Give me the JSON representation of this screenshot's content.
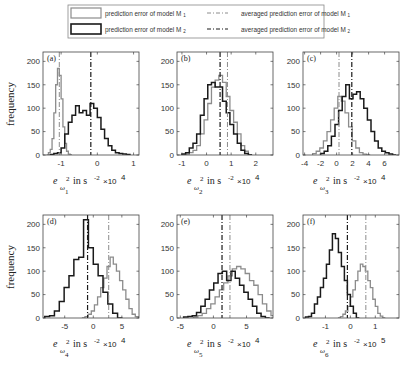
{
  "legend": {
    "entries": [
      {
        "label": "prediction error of model M₁",
        "style": "gray-solid",
        "color": "#8c8c8c"
      },
      {
        "label": "prediction error of model M₂",
        "style": "black-solid",
        "color": "#1a1a1a"
      },
      {
        "label": "averaged prediction error of model M₁",
        "style": "gray-dashdot",
        "color": "#8c8c8c"
      },
      {
        "label": "averaged prediction error of model M₂",
        "style": "black-dashdot",
        "color": "#1a1a1a"
      }
    ],
    "m1_text": "prediction error of model M",
    "m2_text": "prediction error of model M",
    "avg_text": "averaged prediction error of model M",
    "sub1": "1",
    "sub2": "2"
  },
  "ylabel": "frequency",
  "colors": {
    "m1": "#8c8c8c",
    "m2": "#1a1a1a",
    "axis": "#444444"
  },
  "chart_data": [
    {
      "type": "bar",
      "panel": "(a)",
      "title": "",
      "xlabel": "e_{ω1}^2 in s^-2 ×10^4",
      "ylabel": "frequency",
      "xlim": [
        -1.5,
        1.15
      ],
      "ylim": [
        0,
        220
      ],
      "xticks": [
        -1,
        0,
        1
      ],
      "yticks": [
        0,
        50,
        100,
        150,
        200
      ],
      "omega_index": "1",
      "scale": "×10",
      "scale_exp": "4",
      "series": [
        {
          "name": "prediction error of model M1",
          "bin_start": -1.4,
          "bin_width": 0.05,
          "values": [
            0,
            5,
            12,
            35,
            90,
            150,
            185,
            170,
            120,
            60,
            25,
            8,
            2,
            0
          ]
        },
        {
          "name": "prediction error of model M2",
          "bin_start": -1.3,
          "bin_width": 0.1,
          "values": [
            1,
            3,
            5,
            15,
            45,
            70,
            85,
            105,
            90,
            95,
            85,
            110,
            100,
            80,
            55,
            35,
            20,
            10,
            5,
            3,
            2,
            1
          ]
        }
      ],
      "avg": {
        "m1": -1.05,
        "m2": -0.18
      }
    },
    {
      "type": "bar",
      "panel": "(b)",
      "title": "",
      "xlabel": "e_{ω2}^2 in s^-2 ×10^4",
      "ylabel": "",
      "xlim": [
        -1.2,
        2.7
      ],
      "ylim": [
        0,
        220
      ],
      "xticks": [
        -1,
        0,
        1,
        2
      ],
      "yticks": [
        0,
        50,
        100,
        150,
        200
      ],
      "omega_index": "2",
      "scale": "×10",
      "scale_exp": "4",
      "series": [
        {
          "name": "prediction error of model M1",
          "bin_start": -1.0,
          "bin_width": 0.15,
          "values": [
            0,
            2,
            5,
            10,
            20,
            45,
            75,
            110,
            145,
            160,
            170,
            155,
            125,
            95,
            70,
            45,
            20,
            8,
            0
          ]
        },
        {
          "name": "prediction error of model M2",
          "bin_start": -1.0,
          "bin_width": 0.15,
          "values": [
            2,
            5,
            15,
            25,
            45,
            85,
            120,
            150,
            155,
            145,
            145,
            115,
            90,
            65,
            45,
            25,
            10,
            3,
            0
          ]
        }
      ],
      "avg": {
        "m1": 0.85,
        "m2": 0.55
      }
    },
    {
      "type": "bar",
      "panel": "(c)",
      "title": "",
      "xlabel": "e_{ω3}^2 in s^-2 ×10^4",
      "ylabel": "",
      "xlim": [
        -4.2,
        7.8
      ],
      "ylim": [
        0,
        220
      ],
      "xticks": [
        -4,
        -2,
        0,
        2,
        4,
        6
      ],
      "yticks": [
        0,
        50,
        100,
        150,
        200
      ],
      "omega_index": "3",
      "scale": "×10",
      "scale_exp": "4",
      "series": [
        {
          "name": "prediction error of model M1",
          "bin_start": -3.0,
          "bin_width": 0.45,
          "values": [
            3,
            8,
            15,
            30,
            50,
            75,
            100,
            125,
            115,
            90,
            60,
            30,
            15,
            5,
            2,
            0
          ]
        },
        {
          "name": "prediction error of model M2",
          "bin_start": -2.0,
          "bin_width": 0.45,
          "values": [
            3,
            8,
            20,
            40,
            65,
            95,
            125,
            150,
            120,
            130,
            135,
            120,
            100,
            75,
            50,
            30,
            15,
            8,
            5,
            2,
            0
          ]
        }
      ],
      "avg": {
        "m1": 0.3,
        "m2": 1.9
      }
    },
    {
      "type": "bar",
      "panel": "(d)",
      "title": "",
      "xlabel": "e_{ω4}^2 in s^-2 ×10^4",
      "ylabel": "frequency",
      "xlim": [
        -8.8,
        8.0
      ],
      "ylim": [
        0,
        220
      ],
      "xticks": [
        -5,
        0,
        5
      ],
      "yticks": [
        0,
        50,
        100,
        150,
        200
      ],
      "omega_index": "4",
      "scale": "×10",
      "scale_exp": "4",
      "series": [
        {
          "name": "prediction error of model M1",
          "bin_start": -2.0,
          "bin_width": 0.55,
          "values": [
            0,
            3,
            8,
            15,
            28,
            45,
            65,
            85,
            110,
            130,
            115,
            100,
            80,
            60,
            40,
            20,
            8,
            3,
            0
          ]
        },
        {
          "name": "prediction error of model M2",
          "bin_start": -8.5,
          "bin_width": 0.85,
          "values": [
            3,
            5,
            15,
            35,
            65,
            90,
            125,
            130,
            210,
            150,
            115,
            90,
            55,
            30,
            10,
            0
          ]
        }
      ],
      "avg": {
        "m1": 2.7,
        "m2": -1.0
      }
    },
    {
      "type": "bar",
      "panel": "(e)",
      "title": "",
      "xlabel": "e_{ω5}^2 in s^-2 ×10^4",
      "ylabel": "",
      "xlim": [
        -5.5,
        9.0
      ],
      "ylim": [
        0,
        220
      ],
      "xticks": [
        -5,
        0,
        5
      ],
      "yticks": [
        0,
        50,
        100,
        150,
        200
      ],
      "omega_index": "5",
      "scale": "×10",
      "scale_exp": "4",
      "series": [
        {
          "name": "prediction error of model M1",
          "bin_start": -3.0,
          "bin_width": 0.65,
          "values": [
            2,
            5,
            10,
            20,
            30,
            45,
            60,
            75,
            90,
            105,
            110,
            105,
            95,
            80,
            70,
            50,
            30,
            15,
            5,
            2,
            0
          ]
        },
        {
          "name": "prediction error of model M2",
          "bin_start": -4.5,
          "bin_width": 0.65,
          "values": [
            2,
            3,
            5,
            12,
            25,
            40,
            60,
            75,
            95,
            100,
            80,
            100,
            85,
            70,
            55,
            40,
            25,
            10,
            3,
            0
          ]
        }
      ],
      "avg": {
        "m1": 2.5,
        "m2": 1.3
      }
    },
    {
      "type": "bar",
      "panel": "(f)",
      "title": "",
      "xlabel": "e_{ω6}^2 in s^-2 ×10^5",
      "ylabel": "",
      "xlim": [
        -1.9,
        1.95
      ],
      "ylim": [
        0,
        220
      ],
      "xticks": [
        -1,
        0,
        1
      ],
      "yticks": [
        0,
        50,
        100,
        150,
        200
      ],
      "omega_index": "6",
      "scale": "×10",
      "scale_exp": "5",
      "series": [
        {
          "name": "prediction error of model M1",
          "bin_start": -0.5,
          "bin_width": 0.1,
          "values": [
            0,
            3,
            8,
            15,
            25,
            45,
            60,
            80,
            100,
            115,
            110,
            100,
            80,
            65,
            40,
            25,
            10,
            4,
            0
          ]
        },
        {
          "name": "prediction error of model M2",
          "bin_start": -1.8,
          "bin_width": 0.12,
          "values": [
            2,
            3,
            10,
            30,
            45,
            65,
            85,
            115,
            145,
            180,
            170,
            140,
            110,
            80,
            50,
            25,
            10,
            0
          ]
        }
      ],
      "avg": {
        "m1": 0.62,
        "m2": -0.12
      }
    }
  ]
}
